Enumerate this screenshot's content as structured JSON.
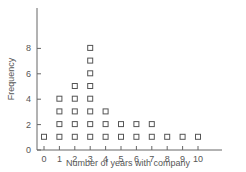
{
  "chart_data": {
    "type": "scatter",
    "subtype": "dot-plot",
    "title": "",
    "xlabel": "Number of years with company",
    "ylabel": "Frequency",
    "categories": [
      "0",
      "1",
      "2",
      "3",
      "4",
      "5",
      "6",
      "7",
      "8",
      "9",
      "10"
    ],
    "x": [
      0,
      1,
      2,
      3,
      4,
      5,
      6,
      7,
      8,
      9,
      10
    ],
    "values": [
      1,
      4,
      5,
      8,
      3,
      2,
      2,
      2,
      1,
      1,
      1
    ],
    "yticks": [
      "0",
      "2",
      "4",
      "6",
      "8"
    ],
    "ylim": [
      0,
      10
    ],
    "xlim": [
      -0.5,
      11
    ],
    "grid": false,
    "legend": null,
    "marker": "open-square"
  },
  "colors": {
    "axis": "#666666",
    "marker": "#555555",
    "text": "#555555"
  }
}
